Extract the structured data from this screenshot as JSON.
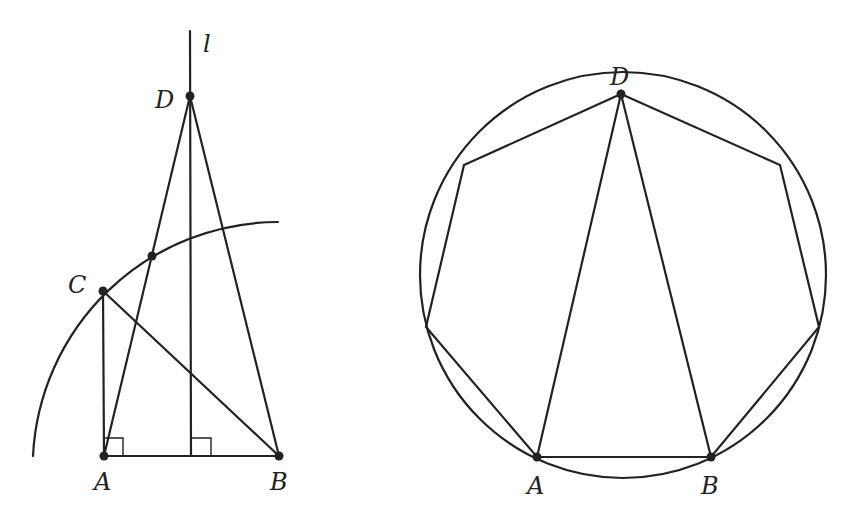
{
  "left_figure": {
    "labels": {
      "A": "A",
      "B": "B",
      "C": "C",
      "D": "D",
      "l": "l"
    },
    "points": {
      "A": [
        104,
        456
      ],
      "B": [
        279,
        456
      ],
      "C": [
        103,
        291
      ],
      "D": [
        190,
        96
      ],
      "E": [
        152,
        256
      ]
    },
    "line_l": {
      "x": 190,
      "y_top": 31,
      "y_bottom": 456
    },
    "arc": {
      "center": "B",
      "radius": 242
    },
    "right_angle_marks": [
      "A",
      "foot of l on AB"
    ]
  },
  "right_figure": {
    "labels": {
      "A": "A",
      "B": "B",
      "D": "D"
    },
    "circle": {
      "cx": 623,
      "cy": 275,
      "r": 203
    },
    "heptagon_vertices": [
      [
        621,
        94
      ],
      [
        780,
        165
      ],
      [
        819,
        327
      ],
      [
        711,
        457
      ],
      [
        537,
        457
      ],
      [
        426,
        327
      ],
      [
        464,
        165
      ]
    ],
    "triangle": [
      "A",
      "B",
      "D"
    ]
  }
}
